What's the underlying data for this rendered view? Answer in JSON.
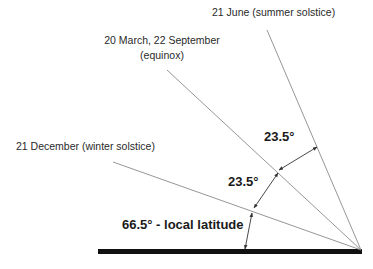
{
  "diagram": {
    "labels": {
      "summer": "21 June (summer solstice)",
      "equinox_line1": "20 March, 22 September",
      "equinox_line2": "(equinox)",
      "winter": "21 December (winter solstice)"
    },
    "angles": {
      "upper": "23.5°",
      "middle": "23.5°",
      "lower": "66.5° - local latitude"
    },
    "colors": {
      "ray": "#8a8a8a",
      "ground": "#111111",
      "arrow": "#333333"
    }
  }
}
